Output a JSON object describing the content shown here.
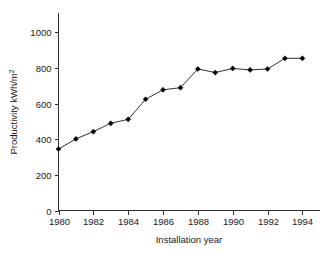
{
  "chart_data": {
    "type": "line",
    "title": "",
    "xlabel": "Installation year",
    "ylabel": "Productivity kWh/m",
    "ylabel_superscript": "2",
    "x": [
      1980,
      1981,
      1982,
      1983,
      1984,
      1985,
      1986,
      1987,
      1988,
      1989,
      1990,
      1991,
      1992,
      1993,
      1994
    ],
    "values": [
      345,
      402,
      443,
      490,
      512,
      625,
      678,
      690,
      795,
      775,
      798,
      790,
      795,
      855,
      855
    ],
    "series": [
      {
        "name": "Productivity",
        "values": [
          345,
          402,
          443,
          490,
          512,
          625,
          678,
          690,
          795,
          775,
          798,
          790,
          795,
          855,
          855
        ]
      }
    ],
    "xlim": [
      1980,
      1994.8
    ],
    "ylim": [
      0,
      1080
    ],
    "xticks": [
      1980,
      1982,
      1984,
      1986,
      1988,
      1990,
      1992,
      1994
    ],
    "xtick_labels": [
      "1980",
      "1982",
      "1984",
      "1986",
      "1988",
      "1990",
      "1992",
      "1994"
    ],
    "yticks": [
      0,
      200,
      400,
      600,
      800,
      1000
    ],
    "ytick_labels": [
      "0",
      "200",
      "400",
      "600",
      "800",
      "1000"
    ],
    "grid": false,
    "legend": false,
    "legend_position": "none",
    "marker": "filled-diamond",
    "line_color": "#333333",
    "marker_color": "#000000",
    "axis_color": "#303030",
    "background_color": "#ffffff"
  },
  "figure": {
    "caption_partial": ""
  }
}
